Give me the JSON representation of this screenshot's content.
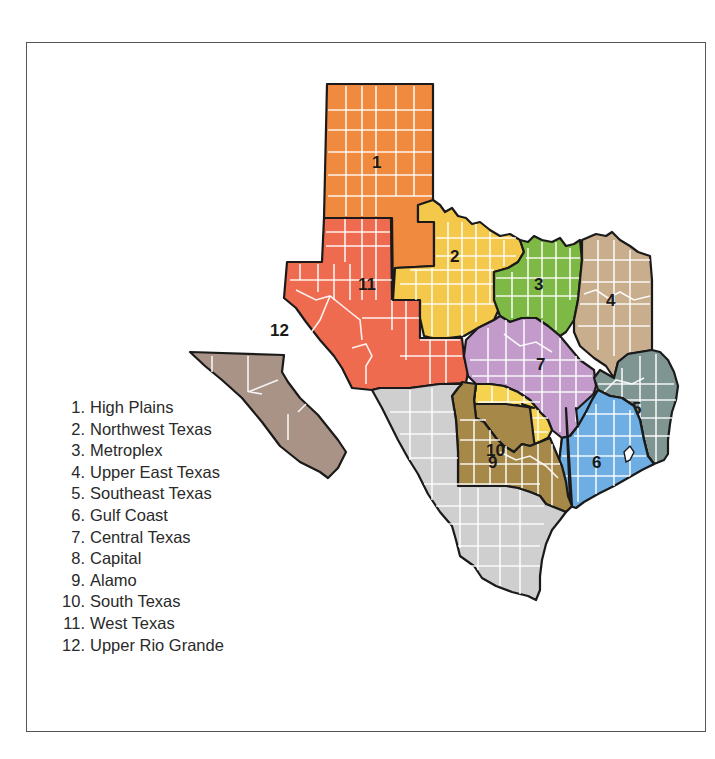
{
  "map": {
    "title": "Texas Regions",
    "regions": [
      {
        "number": "1",
        "name": "High Plains",
        "color": "#F08A3E"
      },
      {
        "number": "2",
        "name": "Northwest Texas",
        "color": "#F3C84B"
      },
      {
        "number": "3",
        "name": "Metroplex",
        "color": "#7DB944"
      },
      {
        "number": "4",
        "name": "Upper East Texas",
        "color": "#C9AE8E"
      },
      {
        "number": "5",
        "name": "Southeast Texas",
        "color": "#7E9592"
      },
      {
        "number": "6",
        "name": "Gulf Coast",
        "color": "#6EAEE3"
      },
      {
        "number": "7",
        "name": "Central Texas",
        "color": "#C39BCB"
      },
      {
        "number": "8",
        "name": "Capital",
        "color": "#F5D250"
      },
      {
        "number": "9",
        "name": "Alamo",
        "color": "#A68848"
      },
      {
        "number": "10",
        "name": "South Texas",
        "color": "#CFCFCF"
      },
      {
        "number": "11",
        "name": "West Texas",
        "color": "#EE6B4F"
      },
      {
        "number": "12",
        "name": "Upper Rio Grande",
        "color": "#A99386"
      }
    ]
  },
  "legend": {
    "items": [
      {
        "label": "1.",
        "text": "High Plains"
      },
      {
        "label": "2.",
        "text": "Northwest Texas"
      },
      {
        "label": "3.",
        "text": "Metroplex"
      },
      {
        "label": "4.",
        "text": "Upper East Texas"
      },
      {
        "label": "5.",
        "text": "Southeast Texas"
      },
      {
        "label": "6.",
        "text": "Gulf Coast"
      },
      {
        "label": "7.",
        "text": "Central Texas"
      },
      {
        "label": "8.",
        "text": "Capital"
      },
      {
        "label": "9.",
        "text": "Alamo"
      },
      {
        "label": "10.",
        "text": "South Texas"
      },
      {
        "label": "11.",
        "text": "West Texas"
      },
      {
        "label": "12.",
        "text": "Upper Rio Grande"
      }
    ]
  }
}
